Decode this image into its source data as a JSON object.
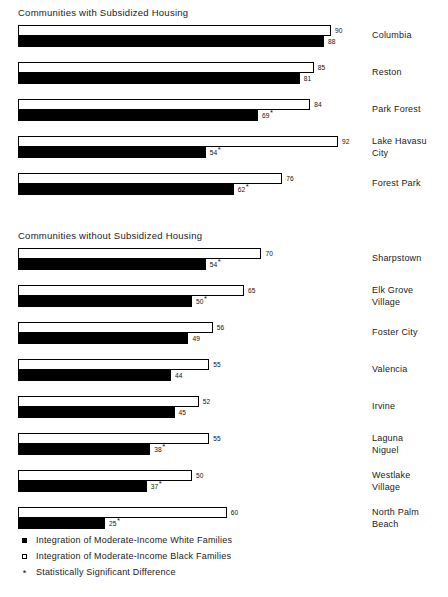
{
  "chart_data": {
    "type": "bar",
    "title": "",
    "orientation": "horizontal",
    "grid": false,
    "xlabel": "",
    "ylabel": "",
    "xlim": [
      0,
      100
    ],
    "legend_position": "bottom-left",
    "series": [
      {
        "name": "Integration of Moderate-Income White Families",
        "marker": "filled-square",
        "color": "#000000"
      },
      {
        "name": "Integration of Moderate-Income Black Families",
        "marker": "hollow-square",
        "color": "#ffffff"
      }
    ],
    "annotations": [
      {
        "symbol": "*",
        "meaning": "Statistically Significant Difference"
      }
    ],
    "sections": [
      {
        "title": "Communities with Subsidized Housing",
        "rows": [
          {
            "label": "Columbia",
            "black_families": 90,
            "white_families": 88,
            "black_significant": false,
            "white_significant": false
          },
          {
            "label": "Reston",
            "black_families": 85,
            "white_families": 81,
            "black_significant": false,
            "white_significant": false
          },
          {
            "label": "Park Forest",
            "black_families": 84,
            "white_families": 69,
            "black_significant": false,
            "white_significant": true
          },
          {
            "label": "Lake Havasu\nCity",
            "black_families": 92,
            "white_families": 54,
            "black_significant": false,
            "white_significant": true
          },
          {
            "label": "Forest Park",
            "black_families": 76,
            "white_families": 62,
            "black_significant": false,
            "white_significant": true
          }
        ]
      },
      {
        "title": "Communities without Subsidized Housing",
        "rows": [
          {
            "label": "Sharpstown",
            "black_families": 70,
            "white_families": 54,
            "black_significant": false,
            "white_significant": true
          },
          {
            "label": "Elk Grove\nVillage",
            "black_families": 65,
            "white_families": 50,
            "black_significant": false,
            "white_significant": true
          },
          {
            "label": "Foster City",
            "black_families": 56,
            "white_families": 49,
            "black_significant": false,
            "white_significant": false
          },
          {
            "label": "Valencia",
            "black_families": 55,
            "white_families": 44,
            "black_significant": false,
            "white_significant": false
          },
          {
            "label": "Irvine",
            "black_families": 52,
            "white_families": 45,
            "black_significant": false,
            "white_significant": false
          },
          {
            "label": "Laguna\nNiguel",
            "black_families": 55,
            "white_families": 38,
            "black_significant": false,
            "white_significant": true
          },
          {
            "label": "Westlake\nVillage",
            "black_families": 50,
            "white_families": 37,
            "black_significant": false,
            "white_significant": true
          },
          {
            "label": "North Palm\nBeach",
            "black_families": 60,
            "white_families": 25,
            "black_significant": false,
            "white_significant": true
          }
        ]
      }
    ]
  },
  "legend": {
    "items": [
      {
        "marker": "filled-square",
        "label": "Integration of Moderate-Income White Families"
      },
      {
        "marker": "hollow-square",
        "label": "Integration of Moderate-Income Black Families"
      },
      {
        "marker": "asterisk",
        "label": "Statistically Significant Difference"
      }
    ]
  }
}
